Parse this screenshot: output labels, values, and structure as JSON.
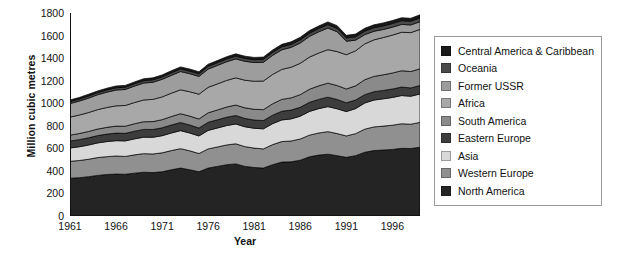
{
  "chart_data": {
    "type": "area",
    "stacked": true,
    "title": "",
    "xlabel": "Year",
    "ylabel": "Million cubic metres",
    "xlim": [
      1961,
      1999
    ],
    "ylim": [
      0,
      1800
    ],
    "ytick_step": 200,
    "grid": false,
    "legend_position": "right",
    "legend_order_top_to_bottom": [
      "Central America & Caribbean",
      "Oceania",
      "Former USSR",
      "Africa",
      "South America",
      "Eastern Europe",
      "Asia",
      "Western Europe",
      "North America"
    ],
    "x": [
      1961,
      1962,
      1963,
      1964,
      1965,
      1966,
      1967,
      1968,
      1969,
      1970,
      1971,
      1972,
      1973,
      1974,
      1975,
      1976,
      1977,
      1978,
      1979,
      1980,
      1981,
      1982,
      1983,
      1984,
      1985,
      1986,
      1987,
      1988,
      1989,
      1990,
      1991,
      1992,
      1993,
      1994,
      1995,
      1996,
      1997,
      1998,
      1999
    ],
    "xticks": [
      1961,
      1966,
      1971,
      1976,
      1981,
      1986,
      1991,
      1996
    ],
    "yticks": [
      0,
      200,
      400,
      600,
      800,
      1000,
      1200,
      1400,
      1600,
      1800
    ],
    "series": [
      {
        "name": "North America",
        "color": "#242424",
        "stack_order": 1,
        "values": [
          335,
          340,
          348,
          360,
          368,
          372,
          370,
          380,
          388,
          385,
          392,
          410,
          425,
          410,
          392,
          425,
          440,
          455,
          462,
          440,
          430,
          425,
          455,
          478,
          480,
          495,
          525,
          540,
          548,
          535,
          520,
          535,
          565,
          580,
          585,
          590,
          600,
          598,
          610
        ]
      },
      {
        "name": "Western Europe",
        "color": "#909090",
        "stack_order": 2,
        "values": [
          150,
          152,
          155,
          158,
          158,
          160,
          158,
          162,
          165,
          165,
          168,
          170,
          172,
          168,
          162,
          170,
          172,
          175,
          178,
          175,
          172,
          170,
          178,
          182,
          185,
          188,
          192,
          196,
          200,
          196,
          190,
          195,
          205,
          210,
          212,
          215,
          218,
          216,
          220
        ]
      },
      {
        "name": "Asia",
        "color": "#d8d8d8",
        "stack_order": 3,
        "values": [
          118,
          122,
          126,
          130,
          134,
          136,
          138,
          142,
          146,
          148,
          152,
          156,
          160,
          158,
          156,
          164,
          168,
          172,
          176,
          176,
          176,
          178,
          186,
          192,
          196,
          202,
          210,
          216,
          222,
          220,
          216,
          222,
          232,
          238,
          242,
          246,
          250,
          248,
          252
        ]
      },
      {
        "name": "Eastern Europe",
        "color": "#3d3d3d",
        "stack_order": 4,
        "values": [
          62,
          63,
          64,
          65,
          66,
          67,
          67,
          68,
          69,
          69,
          70,
          71,
          72,
          71,
          70,
          72,
          73,
          74,
          75,
          74,
          73,
          73,
          75,
          77,
          78,
          79,
          81,
          82,
          84,
          82,
          78,
          76,
          74,
          74,
          74,
          75,
          75,
          74,
          75
        ]
      },
      {
        "name": "South America",
        "color": "#8a8a8a",
        "stack_order": 5,
        "values": [
          52,
          54,
          56,
          58,
          60,
          62,
          63,
          66,
          68,
          70,
          72,
          75,
          78,
          79,
          80,
          84,
          87,
          90,
          93,
          94,
          95,
          97,
          101,
          105,
          108,
          112,
          116,
          120,
          124,
          124,
          122,
          126,
          132,
          136,
          139,
          142,
          145,
          145,
          148
        ]
      },
      {
        "name": "Africa",
        "color": "#a8a8a8",
        "stack_order": 6,
        "values": [
          160,
          164,
          168,
          172,
          176,
          180,
          184,
          188,
          193,
          197,
          202,
          207,
          212,
          216,
          220,
          226,
          231,
          236,
          241,
          245,
          249,
          254,
          260,
          266,
          272,
          278,
          285,
          291,
          297,
          301,
          304,
          310,
          318,
          324,
          330,
          336,
          341,
          345,
          350
        ]
      },
      {
        "name": "Former USSR",
        "color": "#9d9d9d",
        "stack_order": 7,
        "values": [
          120,
          124,
          128,
          132,
          136,
          140,
          142,
          146,
          150,
          152,
          156,
          158,
          162,
          160,
          158,
          162,
          164,
          166,
          168,
          168,
          166,
          166,
          170,
          174,
          176,
          180,
          184,
          188,
          192,
          176,
          120,
          95,
          82,
          76,
          72,
          70,
          70,
          68,
          68
        ]
      },
      {
        "name": "Oceania",
        "color": "#4a4a4a",
        "stack_order": 8,
        "values": [
          18,
          18,
          19,
          19,
          20,
          20,
          20,
          21,
          21,
          22,
          22,
          23,
          23,
          23,
          23,
          24,
          24,
          25,
          25,
          25,
          25,
          26,
          26,
          27,
          27,
          28,
          28,
          29,
          30,
          30,
          29,
          30,
          31,
          32,
          32,
          33,
          33,
          33,
          34
        ]
      },
      {
        "name": "Central America & Caribbean",
        "color": "#1a1a1a",
        "stack_order": 9,
        "values": [
          14,
          14,
          15,
          15,
          15,
          16,
          16,
          16,
          17,
          17,
          17,
          18,
          18,
          18,
          18,
          19,
          19,
          19,
          20,
          20,
          20,
          20,
          21,
          21,
          22,
          22,
          23,
          23,
          24,
          24,
          23,
          24,
          25,
          25,
          26,
          26,
          26,
          26,
          27
        ]
      }
    ],
    "totals": [
      1029,
      1051,
      1079,
      1109,
      1133,
      1153,
      1158,
      1189,
      1217,
      1225,
      1251,
      1298,
      1342,
      1323,
      1279,
      1346,
      1398,
      1442,
      1478,
      1457,
      1436,
      1429,
      1492,
      1552,
      1584,
      1634,
      1704,
      1745,
      1771,
      1688,
      1502,
      1543,
      1614,
      1655,
      1682,
      1713,
      1748,
      1743,
      1784
    ]
  }
}
